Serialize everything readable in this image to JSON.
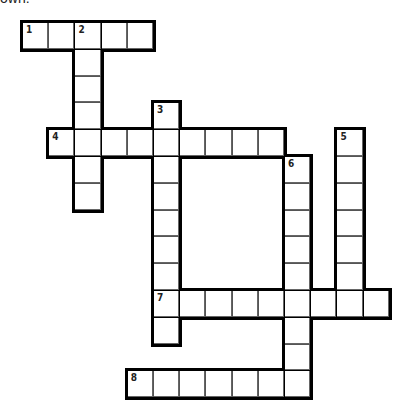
{
  "header": {
    "partial_text": "own:"
  },
  "layout": {
    "x0": 22,
    "y0": 22,
    "cw": 26.2,
    "ch": 26.8
  },
  "clues": [
    {
      "number": "1",
      "direction": "across",
      "row": 0,
      "col": 0,
      "length": 5
    },
    {
      "number": "2",
      "direction": "down",
      "row": 0,
      "col": 2,
      "length": 7
    },
    {
      "number": "3",
      "direction": "down",
      "row": 3,
      "col": 5,
      "length": 9
    },
    {
      "number": "4",
      "direction": "across",
      "row": 4,
      "col": 1,
      "length": 9
    },
    {
      "number": "5",
      "direction": "down",
      "row": 4,
      "col": 12,
      "length": 7
    },
    {
      "number": "6",
      "direction": "down",
      "row": 5,
      "col": 10,
      "length": 9
    },
    {
      "number": "7",
      "direction": "across",
      "row": 10,
      "col": 5,
      "length": 9
    },
    {
      "number": "8",
      "direction": "across",
      "row": 13,
      "col": 4,
      "length": 7
    }
  ]
}
